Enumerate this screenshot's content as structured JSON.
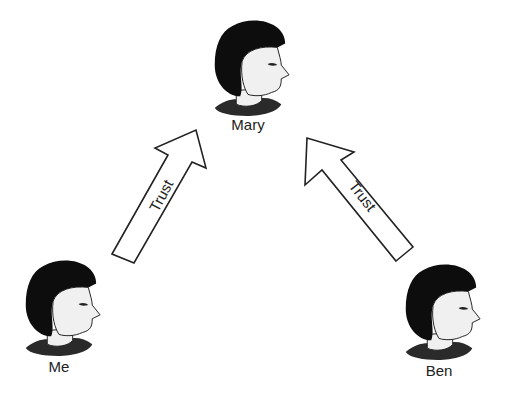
{
  "diagram": {
    "type": "trust relationship diagram",
    "nodes": [
      {
        "id": "mary",
        "label": "Mary",
        "icon": "person-head-icon"
      },
      {
        "id": "me",
        "label": "Me",
        "icon": "person-head-icon"
      },
      {
        "id": "ben",
        "label": "Ben",
        "icon": "person-head-icon"
      }
    ],
    "edges": [
      {
        "from": "me",
        "to": "mary",
        "label": "Trust"
      },
      {
        "from": "ben",
        "to": "mary",
        "label": "Trust"
      }
    ],
    "colors": {
      "hair": "#0d0d0d",
      "face": "#f0f0f0",
      "collar": "#2a2a2a",
      "outline": "#222222",
      "background": "#ffffff"
    }
  }
}
